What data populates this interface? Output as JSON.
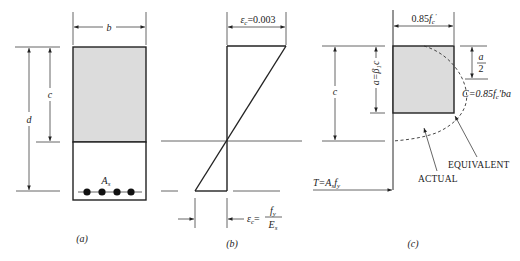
{
  "figure": {
    "panels": [
      {
        "id": "a",
        "caption": "(a)",
        "labels": {
          "width": "b",
          "neutral_axis_depth": "c",
          "effective_depth": "d",
          "steel_area": "A",
          "steel_area_sub": "s"
        },
        "rebar_count": 4
      },
      {
        "id": "b",
        "caption": "(b)",
        "labels": {
          "top_strain_symbol": "ε",
          "top_strain_sub": "c",
          "top_strain_value": "=0.003",
          "steel_strain_symbol": "ε",
          "steel_strain_sub": "c",
          "steel_strain_eq": "=",
          "steel_strain_num": "f",
          "steel_strain_num_sub": "y",
          "steel_strain_den": "E",
          "steel_strain_den_sub": "s"
        }
      },
      {
        "id": "c",
        "caption": "(c)",
        "labels": {
          "stress_width": "0.85",
          "stress_width_f": "f",
          "stress_width_sub": "c",
          "stress_width_prime": "'",
          "neutral_axis_depth": "c",
          "block_depth": "a=β",
          "block_depth_sub": "1",
          "block_depth_c": "c",
          "half_depth_num": "a",
          "half_depth_den": "2",
          "compression_force": "C=0.85",
          "compression_f": "f",
          "compression_sub": "c",
          "compression_tail": "'ba",
          "tension_force": "T=A",
          "tension_sub_s": "s",
          "tension_f": "f",
          "tension_sub_y": "y",
          "equivalent_label": "EQUIVALENT",
          "actual_label": "ACTUAL"
        }
      }
    ],
    "colors": {
      "line": "#2a2a2a",
      "compression_fill": "#dcdcdc",
      "rebar": "#111111"
    }
  }
}
